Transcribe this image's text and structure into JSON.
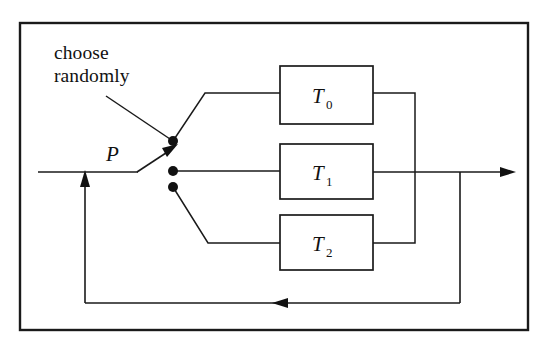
{
  "figure": {
    "kind": "block-diagram",
    "background_color": "#ffffff",
    "line_color": "#1a1a1a",
    "frame": {
      "name": "outer-border",
      "x": 20,
      "y": 23,
      "width": 508,
      "height": 307
    },
    "annotation": {
      "line1": "choose",
      "line2": "randomly",
      "x": 54,
      "y": 42
    },
    "input_label": {
      "text": "P",
      "x": 106,
      "y": 161
    },
    "switch": {
      "name": "random-switch",
      "contacts": [
        {
          "id": "contact-0",
          "cx": 173,
          "cy": 141
        },
        {
          "id": "contact-1",
          "cx": 173,
          "cy": 171
        },
        {
          "id": "contact-2",
          "cx": 173,
          "cy": 187
        }
      ],
      "arm_from": {
        "x": 137,
        "y": 172
      },
      "arm_to": {
        "x": 176,
        "y": 146
      }
    },
    "blocks": [
      {
        "id": "block-t0",
        "label": "T",
        "subscript": "0",
        "x": 280,
        "y": 66,
        "width": 93,
        "height": 58
      },
      {
        "id": "block-t1",
        "label": "T",
        "subscript": "1",
        "x": 280,
        "y": 144,
        "width": 93,
        "height": 55
      },
      {
        "id": "block-t2",
        "label": "T",
        "subscript": "2",
        "x": 280,
        "y": 215,
        "width": 93,
        "height": 55
      }
    ],
    "buses": {
      "output_bus_x": 415,
      "feedback_bus_x": 460,
      "main_line_y": 172,
      "feedback_line_y": 303,
      "feedback_left_x": 85,
      "input_line_start_x": 38,
      "output_arrow_x": 512
    },
    "arrows": [
      {
        "id": "switch-arm-arrow",
        "direction": "up-right"
      },
      {
        "id": "feedback-left-arrow",
        "direction": "left"
      },
      {
        "id": "feedback-up-arrow",
        "direction": "up"
      },
      {
        "id": "output-arrow",
        "direction": "right"
      }
    ]
  }
}
